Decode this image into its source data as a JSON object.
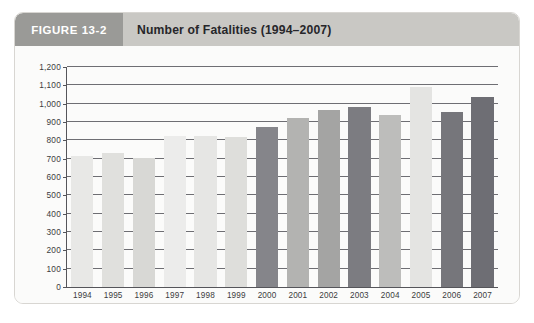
{
  "figure": {
    "badge_label": "FIGURE 13-2",
    "title": "Number of Fatalities (1994–2007)"
  },
  "chart_data": {
    "type": "bar",
    "title": "Number of Fatalities (1994–2007)",
    "xlabel": "Year",
    "ylabel": "",
    "ylim": [
      0,
      1200
    ],
    "ytick_step": 100,
    "grid": true,
    "legend": "none",
    "categories": [
      "1994",
      "1995",
      "1996",
      "1997",
      "1998",
      "1999",
      "2000",
      "2001",
      "2002",
      "2003",
      "2004",
      "2005",
      "2006",
      "2007"
    ],
    "values": [
      715,
      730,
      705,
      825,
      825,
      820,
      875,
      920,
      965,
      980,
      940,
      1090,
      955,
      1035
    ],
    "bar_colors": [
      "#e8e8e6",
      "#e0e0dd",
      "#d8d8d5",
      "#ececeb",
      "#e6e6e4",
      "#dededb",
      "#85858a",
      "#b3b3b1",
      "#a4a4a3",
      "#7c7c81",
      "#bdbdbb",
      "#e4e4e2",
      "#76767b",
      "#6e6e74"
    ],
    "ytick_labels": [
      "0",
      "100",
      "200",
      "300",
      "400",
      "500",
      "600",
      "700",
      "800",
      "900",
      "1,000",
      "1,100",
      "1,200"
    ],
    "xtick_labels": [
      "1994",
      "1995",
      "1996",
      "1997",
      "1998",
      "1999",
      "2000",
      "2001",
      "2002",
      "2003",
      "2004",
      "2005",
      "2006",
      "2007"
    ]
  },
  "axis": {
    "x_title": "Year"
  }
}
